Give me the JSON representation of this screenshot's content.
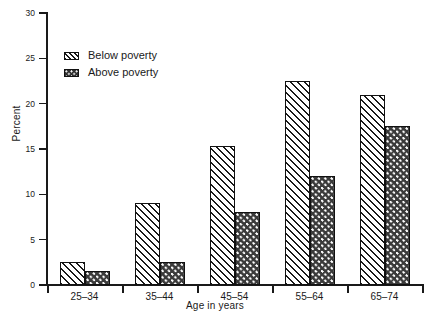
{
  "chart_data": {
    "type": "bar",
    "title": "",
    "subtitle": "",
    "xlabel": "Age in years",
    "ylabel": "Percent",
    "categories": [
      "25–34",
      "35–44",
      "45–54",
      "55–64",
      "65–74"
    ],
    "series": [
      {
        "name": "Below poverty",
        "values": [
          2.5,
          9.0,
          15.3,
          22.5,
          21.0
        ],
        "pattern": "diagonal-hatch",
        "color": "#ffffff"
      },
      {
        "name": "Above poverty",
        "values": [
          1.5,
          2.5,
          8.0,
          12.0,
          17.5
        ],
        "pattern": "dotted-fill",
        "color": "#3a3a3a"
      }
    ],
    "ylim": [
      0,
      30
    ],
    "ytick_values": [
      0,
      5,
      10,
      15,
      20,
      25,
      30
    ],
    "ytick_labels": [
      "0",
      "5",
      "10",
      "15",
      "20",
      "25",
      "30"
    ],
    "grid": false,
    "legend_position": "upper-left-inside",
    "annotations": []
  },
  "legend": {
    "entries": [
      {
        "label": "Below poverty"
      },
      {
        "label": "Above poverty"
      }
    ]
  },
  "axes": {
    "y_title": "Percent",
    "x_title": "Age in years"
  },
  "colors": {
    "axis": "#1a1a1a",
    "text": "#1a1a1a",
    "background": "#ffffff",
    "below_poverty_fill": "#ffffff",
    "above_poverty_fill": "#3a3a3a"
  }
}
